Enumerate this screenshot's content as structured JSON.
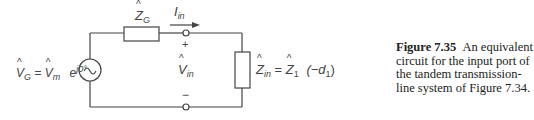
{
  "diagram": {
    "type": "equivalent-circuit",
    "source_label": {
      "lhs_symbol": "V",
      "lhs_sub": "G",
      "equals": "=",
      "rhs_symbol": "V",
      "rhs_sub": "m",
      "exp_base": "e",
      "exp": "j0°"
    },
    "series_impedance": {
      "symbol": "Z",
      "sub": "G"
    },
    "current": {
      "symbol": "I",
      "sub": "in"
    },
    "voltage": {
      "symbol": "V",
      "sub": "in",
      "plus": "+",
      "minus": "−"
    },
    "load_impedance": {
      "symbol": "Z",
      "sub": "in",
      "equals": "=",
      "rhs_symbol": "Z",
      "rhs_sub": "1",
      "arg": "(−d",
      "arg_sub": "1",
      "arg_close": ")"
    },
    "source_symbol": "~"
  },
  "caption": {
    "figure_label": "Figure 7.35",
    "text": "An equivalent circuit for the input port of the tandem transmission-line system of Figure 7.34."
  }
}
